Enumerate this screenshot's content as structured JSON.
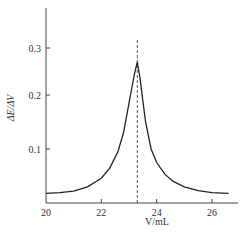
{
  "chart_data": {
    "type": "line",
    "title": "",
    "xlabel": "V/mL",
    "ylabel": "ΔE/ΔV",
    "xlim": [
      20,
      26.7
    ],
    "ylim": [
      0,
      0.37
    ],
    "x_ticks": [
      20,
      22,
      24,
      26
    ],
    "x_tick_labels": [
      "20",
      "22",
      "24",
      "26"
    ],
    "y_ticks": [
      0.1,
      0.2,
      0.3
    ],
    "y_tick_labels": [
      "0.1",
      "0.2",
      "0.3"
    ],
    "grid": false,
    "legend": null,
    "series": [
      {
        "name": "ΔE/ΔV",
        "x": [
          20.0,
          20.5,
          21.0,
          21.5,
          22.0,
          22.3,
          22.6,
          22.8,
          23.0,
          23.1,
          23.2,
          23.3,
          23.4,
          23.5,
          23.6,
          23.8,
          24.0,
          24.3,
          24.6,
          25.0,
          25.5,
          26.0,
          26.6
        ],
        "y": [
          0.018,
          0.019,
          0.022,
          0.03,
          0.046,
          0.064,
          0.095,
          0.13,
          0.185,
          0.215,
          0.245,
          0.27,
          0.235,
          0.19,
          0.15,
          0.1,
          0.075,
          0.053,
          0.04,
          0.03,
          0.023,
          0.019,
          0.018
        ]
      }
    ],
    "annotations": [
      {
        "type": "vertical-dashed-line",
        "x": 23.3,
        "label": "equivalence point"
      }
    ]
  }
}
